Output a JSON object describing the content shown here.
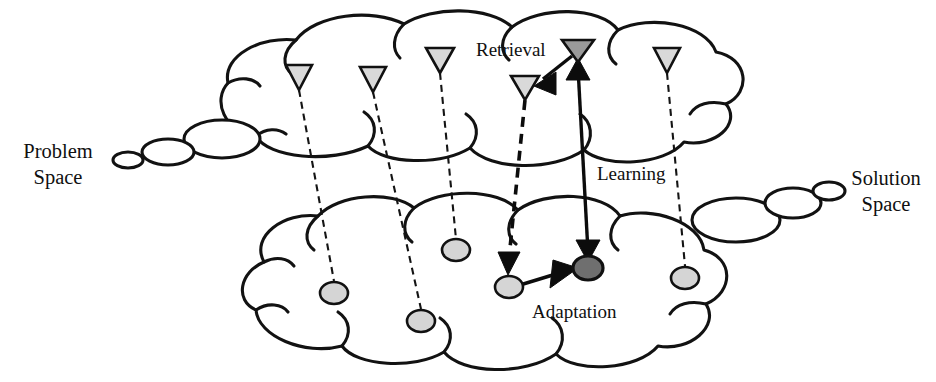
{
  "figure": {
    "type": "diagram",
    "background": "#ffffff",
    "ink_color": "#111111"
  },
  "labels": {
    "problem_space": "Problem\nSpace",
    "solution_space": "Solution\nSpace",
    "retrieval": "Retrieval",
    "learning": "Learning",
    "adaptation": "Adaptation"
  },
  "legend_colors": {
    "light_fill": "#d9d9d9",
    "gray_fill": "#9a9a9a",
    "dark_fill": "#6f6f6f",
    "stroke": "#111111"
  },
  "clouds": [
    {
      "name": "problem-space-cloud",
      "side": "top",
      "tail_side": "left"
    },
    {
      "name": "solution-space-cloud",
      "side": "bottom",
      "tail_side": "right"
    }
  ],
  "problem_nodes": [
    {
      "id": "p1",
      "shape": "triangle",
      "fill": "light",
      "cx": 299,
      "cy": 77
    },
    {
      "id": "p2",
      "shape": "triangle",
      "fill": "light",
      "cx": 373,
      "cy": 79
    },
    {
      "id": "p3",
      "shape": "triangle",
      "fill": "light",
      "cx": 440,
      "cy": 60
    },
    {
      "id": "p4",
      "shape": "triangle",
      "fill": "light",
      "cx": 525,
      "cy": 88
    },
    {
      "id": "p5",
      "shape": "triangle",
      "fill": "gray",
      "cx": 578,
      "cy": 50
    },
    {
      "id": "p6",
      "shape": "triangle",
      "fill": "light",
      "cx": 667,
      "cy": 60
    }
  ],
  "solution_nodes": [
    {
      "id": "s1",
      "shape": "circle",
      "fill": "light",
      "cx": 334,
      "cy": 293
    },
    {
      "id": "s2",
      "shape": "circle",
      "fill": "light",
      "cx": 421,
      "cy": 321
    },
    {
      "id": "s3",
      "shape": "circle",
      "fill": "light",
      "cx": 456,
      "cy": 250
    },
    {
      "id": "s4",
      "shape": "circle",
      "fill": "light",
      "cx": 509,
      "cy": 287
    },
    {
      "id": "s5",
      "shape": "circle",
      "fill": "dark",
      "cx": 588,
      "cy": 268
    },
    {
      "id": "s6",
      "shape": "circle",
      "fill": "light",
      "cx": 685,
      "cy": 278
    }
  ],
  "mappings": [
    {
      "from": "p1",
      "to": "s1",
      "style": "dashed"
    },
    {
      "from": "p2",
      "to": "s2",
      "style": "dashed"
    },
    {
      "from": "p3",
      "to": "s3",
      "style": "dashed"
    },
    {
      "from": "p4",
      "to": "s4",
      "style": "dashed-arrow"
    },
    {
      "from": "p5",
      "to": "s5",
      "style": "solid-double-arrow"
    },
    {
      "from": "p6",
      "to": "s6",
      "style": "dashed"
    }
  ],
  "process_arrows": [
    {
      "name": "retrieval-arrow",
      "label": "Retrieval",
      "from": "p5",
      "to": "p4",
      "style": "solid-arrow",
      "direction": "down-left"
    },
    {
      "name": "learning-arrow",
      "label": "Learning",
      "from": "s5",
      "to": "p5",
      "style": "solid-double-arrow",
      "direction": "vertical"
    },
    {
      "name": "adaptation-arrow",
      "label": "Adaptation",
      "from": "s4",
      "to": "s5",
      "style": "solid-arrow",
      "direction": "right"
    }
  ]
}
